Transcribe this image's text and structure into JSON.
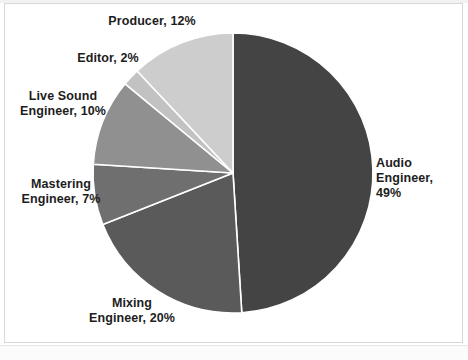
{
  "chart_data": {
    "type": "pie",
    "title": "",
    "subtitle": "",
    "xlabel": "",
    "ylabel": "",
    "legend_position": "none",
    "grid": false,
    "units": "percent",
    "total": 100,
    "start_angle_deg": 0,
    "direction": "clockwise",
    "categories": [
      "Audio Engineer",
      "Mixing Engineer",
      "Mastering Engineer",
      "Live Sound Engineer",
      "Editor",
      "Producer"
    ],
    "values": [
      49,
      20,
      7,
      10,
      2,
      12
    ],
    "slices": [
      {
        "name": "Audio Engineer",
        "value": 49,
        "value_text": "49%",
        "label": "Audio Engineer,\n49%",
        "color": "#444444",
        "start_deg": 0,
        "end_deg": 176.4
      },
      {
        "name": "Mixing Engineer",
        "value": 20,
        "value_text": "20%",
        "label": "Mixing\nEngineer, 20%",
        "color": "#5a5a5a",
        "start_deg": 176.4,
        "end_deg": 248.4
      },
      {
        "name": "Mastering Engineer",
        "value": 7,
        "value_text": "7%",
        "label": "Mastering\nEngineer, 7%",
        "color": "#6f6f6f",
        "start_deg": 248.4,
        "end_deg": 273.6
      },
      {
        "name": "Live Sound Engineer",
        "value": 10,
        "value_text": "10%",
        "label": "Live Sound\nEngineer, 10%",
        "color": "#909090",
        "start_deg": 273.6,
        "end_deg": 309.6
      },
      {
        "name": "Editor",
        "value": 2,
        "value_text": "2%",
        "label": "Editor, 2%",
        "color": "#c2c2c2",
        "start_deg": 309.6,
        "end_deg": 316.8
      },
      {
        "name": "Producer",
        "value": 12,
        "value_text": "12%",
        "label": "Producer, 12%",
        "color": "#cdcdcd",
        "start_deg": 316.8,
        "end_deg": 360
      }
    ],
    "geometry": {
      "center_x": 233,
      "center_y": 173,
      "radius": 140,
      "slice_border_color": "#ffffff",
      "slice_border_width": 1.6
    },
    "background_color": "#ffffff",
    "label_color": "#1d1d1d"
  },
  "labels": {
    "audio_engineer": "Audio Engineer,\n49%",
    "mixing_engineer": "Mixing\nEngineer, 20%",
    "mastering_engineer": "Mastering\nEngineer, 7%",
    "live_sound_engineer": "Live Sound\nEngineer, 10%",
    "editor": "Editor, 2%",
    "producer": "Producer, 12%"
  }
}
